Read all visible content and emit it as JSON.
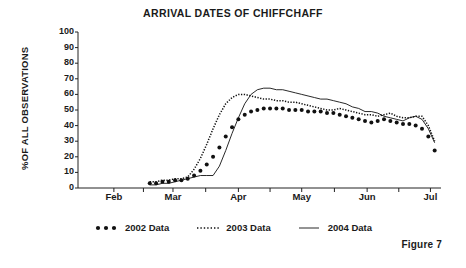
{
  "chart_data": {
    "type": "line",
    "title": "ARRIVAL DATES OF CHIFFCHAFF",
    "xlabel": "",
    "ylabel": "%OF ALL OBSERVATIONS",
    "ylim": [
      0,
      100
    ],
    "ytick_labels": [
      "100",
      "90",
      "80",
      "70",
      "60",
      "50",
      "40",
      "30",
      "20",
      "10",
      "0"
    ],
    "ytick_values": [
      100,
      90,
      80,
      70,
      60,
      50,
      40,
      30,
      20,
      10,
      0
    ],
    "xtick_labels": [
      "Feb",
      "Mar",
      "Apr",
      "May",
      "Jun",
      "Jul"
    ],
    "xtick_values": [
      0,
      28,
      59,
      89,
      120,
      150
    ],
    "xlim": [
      -17,
      155
    ],
    "grid": false,
    "legend_position": "bottom",
    "x": [
      17,
      20,
      23,
      26,
      29,
      32,
      35,
      38,
      41,
      44,
      47,
      50,
      53,
      56,
      59,
      62,
      65,
      68,
      71,
      74,
      77,
      80,
      83,
      86,
      89,
      92,
      95,
      98,
      101,
      104,
      107,
      110,
      113,
      116,
      119,
      122,
      125,
      128,
      131,
      134,
      137,
      140,
      143,
      146,
      149,
      152
    ],
    "series": [
      {
        "name": "2002 Data",
        "style": "thick-dotted",
        "values": [
          3,
          3,
          4,
          4,
          5,
          5,
          6,
          8,
          11,
          15,
          20,
          26,
          33,
          39,
          44,
          47,
          49,
          50,
          51,
          51,
          51,
          51,
          50,
          50,
          50,
          49,
          49,
          49,
          48,
          48,
          47,
          46,
          45,
          44,
          43,
          42,
          43,
          44,
          43,
          42,
          41,
          41,
          40,
          38,
          33,
          24
        ]
      },
      {
        "name": "2003 Data",
        "style": "fine-dotted",
        "values": [
          4,
          4,
          5,
          5,
          6,
          6,
          7,
          12,
          19,
          28,
          38,
          47,
          54,
          58,
          60,
          60,
          59,
          58,
          57,
          57,
          56,
          56,
          55,
          55,
          54,
          53,
          52,
          51,
          50,
          50,
          51,
          50,
          49,
          48,
          47,
          47,
          46,
          47,
          48,
          46,
          45,
          45,
          46,
          46,
          40,
          30
        ]
      },
      {
        "name": "2004 Data",
        "style": "solid",
        "values": [
          2,
          2,
          3,
          3,
          4,
          5,
          6,
          7,
          8,
          8,
          8,
          14,
          24,
          35,
          45,
          54,
          60,
          63,
          64,
          64,
          63,
          63,
          62,
          61,
          60,
          59,
          58,
          57,
          57,
          56,
          55,
          54,
          52,
          51,
          49,
          49,
          48,
          46,
          45,
          44,
          43,
          45,
          46,
          44,
          38,
          29
        ]
      }
    ]
  },
  "caption": {
    "figure_label": "Figure 7"
  },
  "legend": {
    "items": [
      {
        "label": "2002 Data",
        "swatch": "thick-dotted-swatch"
      },
      {
        "label": "2003 Data",
        "swatch": "fine-dotted-swatch"
      },
      {
        "label": "2004 Data",
        "swatch": "solid-line-swatch"
      }
    ]
  }
}
